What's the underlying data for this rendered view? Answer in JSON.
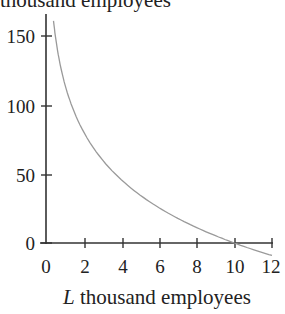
{
  "chart_data": {
    "type": "line",
    "title": "",
    "ylabel": "thousand employees",
    "xlabel_var": "L",
    "xlabel_text": " thousand employees",
    "xlabel": "L thousand employees",
    "xlim": [
      0,
      12
    ],
    "ylim": [
      0,
      150
    ],
    "xticks": [
      0,
      2,
      4,
      6,
      8,
      10,
      12
    ],
    "yticks": [
      0,
      50,
      100,
      150
    ],
    "grid": false,
    "legend": null,
    "series": [
      {
        "name": "curve",
        "color": "#9a9a9a",
        "x": [
          0.4,
          0.55,
          0.75,
          1,
          1.4,
          2,
          3,
          4,
          5,
          6,
          7,
          8,
          9,
          10,
          11,
          12
        ],
        "y": [
          161,
          145,
          130,
          115,
          98,
          80,
          60,
          46,
          35,
          26,
          18,
          11,
          5,
          0,
          -5,
          -9
        ]
      }
    ],
    "annotations": []
  },
  "labels": {
    "top_label": "thousand employees",
    "x_tick_labels": [
      "0",
      "2",
      "4",
      "6",
      "8",
      "10",
      "12"
    ],
    "y_tick_labels": [
      "0",
      "50",
      "100",
      "150"
    ]
  }
}
